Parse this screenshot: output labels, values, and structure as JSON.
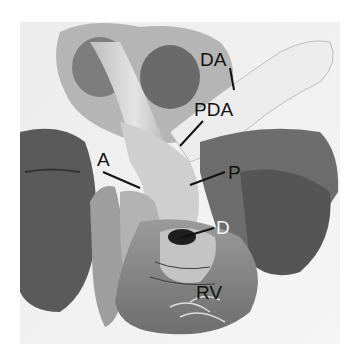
{
  "figure": {
    "type": "anatomical photograph",
    "labels": [
      {
        "text": "DA",
        "x": 200,
        "y": 50,
        "color": "dark"
      },
      {
        "text": "PDA",
        "x": 194,
        "y": 100,
        "color": "dark"
      },
      {
        "text": "A",
        "x": 97,
        "y": 150,
        "color": "dark"
      },
      {
        "text": "P",
        "x": 228,
        "y": 163,
        "color": "dark"
      },
      {
        "text": "D",
        "x": 216,
        "y": 218,
        "color": "light"
      },
      {
        "text": "RV",
        "x": 196,
        "y": 283,
        "color": "dark"
      }
    ],
    "colors": {
      "background": "#ffffff",
      "tissue_dark": "#4a4a4a",
      "tissue_mid": "#8a8a8a",
      "tissue_light": "#d4d4d4"
    }
  }
}
